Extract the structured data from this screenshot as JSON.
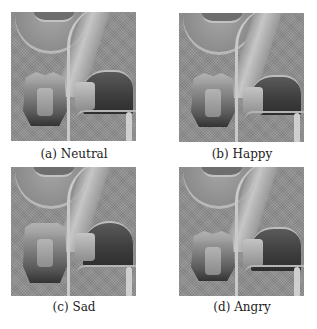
{
  "figure": {
    "panels": [
      {
        "id": "a",
        "caption": "(a) Neutral",
        "expression": "Neutral"
      },
      {
        "id": "b",
        "caption": "(b) Happy",
        "expression": "Happy"
      },
      {
        "id": "c",
        "caption": "(c) Sad",
        "expression": "Sad"
      },
      {
        "id": "d",
        "caption": "(d) Angry",
        "expression": "Angry"
      }
    ],
    "colors": {
      "background": "#ffffff",
      "panel_gray": "#8e8e8e",
      "caption_text": "#222222"
    }
  }
}
